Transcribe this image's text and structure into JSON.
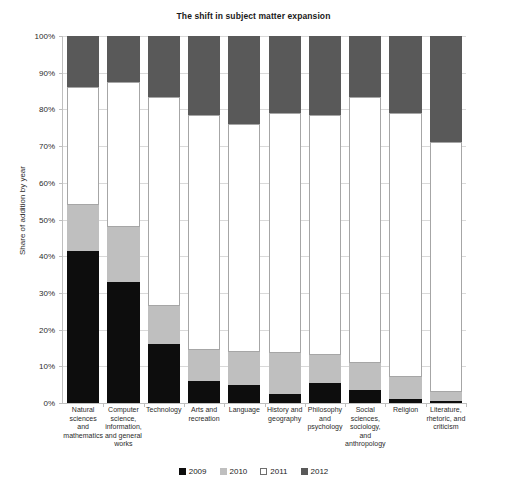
{
  "chart_data": {
    "type": "bar",
    "stacked": true,
    "stack_mode": "percent",
    "title": "The shift in subject matter expansion",
    "xlabel": "",
    "ylabel": "Share of addition by year",
    "ylim": [
      0,
      100
    ],
    "ytick_values": [
      0,
      10,
      20,
      30,
      40,
      50,
      60,
      70,
      80,
      90,
      100
    ],
    "ytick_labels": [
      "0%",
      "10%",
      "20%",
      "30%",
      "40%",
      "50%",
      "60%",
      "70%",
      "80%",
      "90%",
      "100%"
    ],
    "grid": true,
    "legend_position": "bottom",
    "categories": [
      "Natural sciences and mathematics",
      "Computer science, information, and general works",
      "Technology",
      "Arts and recreation",
      "Language",
      "History and geography",
      "Philosophy and psychology",
      "Social sciences, sociology, and anthropology",
      "Religion",
      "Literature, rhetoric, and criticism"
    ],
    "series": [
      {
        "name": "2009",
        "color": "#0d0d0d",
        "values": [
          41.5,
          33.0,
          16.0,
          6.0,
          5.0,
          2.5,
          5.5,
          3.5,
          1.0,
          0.5
        ]
      },
      {
        "name": "2010",
        "color": "#bfbfbf",
        "values": [
          12.5,
          15.0,
          10.5,
          8.5,
          9.0,
          11.0,
          7.5,
          7.5,
          6.0,
          2.5
        ]
      },
      {
        "name": "2011",
        "color": "#ffffff",
        "values": [
          32.0,
          39.5,
          57.0,
          64.0,
          62.0,
          65.5,
          65.5,
          72.5,
          72.0,
          68.0
        ]
      },
      {
        "name": "2012",
        "color": "#595959",
        "values": [
          14.0,
          12.5,
          16.5,
          21.5,
          24.0,
          21.0,
          21.5,
          16.5,
          21.0,
          29.0
        ]
      }
    ],
    "cumulative_tops": {
      "2009": [
        41.5,
        33.0,
        16.0,
        6.0,
        5.0,
        2.5,
        5.5,
        3.5,
        1.0,
        0.5
      ],
      "2010": [
        54.0,
        48.0,
        26.5,
        14.5,
        14.0,
        13.5,
        13.0,
        11.0,
        7.0,
        3.0
      ],
      "2011": [
        86.0,
        87.5,
        83.5,
        78.5,
        76.0,
        79.0,
        78.5,
        83.5,
        79.0,
        71.0
      ],
      "2012": [
        100,
        100,
        100,
        100,
        100,
        100,
        100,
        100,
        100,
        100
      ]
    }
  },
  "legend": {
    "items": [
      {
        "label": "2009",
        "key": "y2009"
      },
      {
        "label": "2010",
        "key": "y2010"
      },
      {
        "label": "2011",
        "key": "y2011"
      },
      {
        "label": "2012",
        "key": "y2012"
      }
    ]
  }
}
